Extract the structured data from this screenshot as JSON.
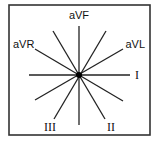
{
  "diagram": {
    "frame": {
      "x": 9,
      "y": 5,
      "width": 141,
      "height": 130,
      "stroke": "#333333"
    },
    "center": {
      "x": 79,
      "y": 75,
      "dot_radius": 3
    },
    "line_color": "#222222",
    "axes": [
      {
        "name": "I",
        "angle_deg": 0,
        "length": 51
      },
      {
        "name": "aVL",
        "angle_deg": -30,
        "length": 51
      },
      {
        "name": "aVF-axis",
        "angle_deg": -90,
        "length": 50
      },
      {
        "name": "II-axis",
        "angle_deg": 60,
        "length": 50
      },
      {
        "name": "III-axis",
        "angle_deg": 120,
        "length": 50
      },
      {
        "name": "aVR-axis",
        "angle_deg": -150,
        "length": 51
      }
    ],
    "labels": {
      "aVF": "aVF",
      "aVR": "aVR",
      "aVL": "aVL",
      "I": "I",
      "II": "II",
      "III": "III"
    }
  }
}
